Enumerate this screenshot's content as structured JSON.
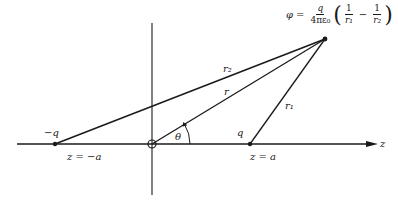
{
  "diagram": {
    "title_formula": {
      "lhs": "φ",
      "equals": "=",
      "prefactor_num": "q",
      "prefactor_den": "4πε₀",
      "term1_num": "1",
      "term1_den": "r₁",
      "minus": "−",
      "term2_num": "1",
      "term2_den": "r₂"
    },
    "labels": {
      "neg_charge": "−q",
      "pos_charge": "q",
      "neg_position": "z = −a",
      "pos_position": "z = a",
      "axis": "z",
      "r": "r",
      "r1": "r₁",
      "r2": "r₂",
      "theta": "θ"
    },
    "colors": {
      "ink": "#1a1a1a",
      "background": "#ffffff"
    }
  }
}
